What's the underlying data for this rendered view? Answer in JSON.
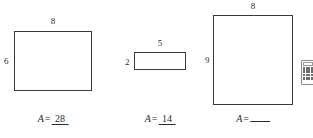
{
  "page": {
    "background_color": "#ffffff",
    "ink_color": "#3a3a3a"
  },
  "figures": [
    {
      "id": "figure-1",
      "name": "rectangle-1",
      "top_label": "8",
      "left_label": "6",
      "area_variable": "A",
      "equals": "=",
      "area_value": "28",
      "answered": true
    },
    {
      "id": "figure-2",
      "name": "rectangle-2",
      "top_label": "5",
      "left_label": "2",
      "area_variable": "A",
      "equals": "=",
      "area_value": "14",
      "answered": true
    },
    {
      "id": "figure-3",
      "name": "rectangle-3",
      "top_label": "8",
      "left_label": "9",
      "area_variable": "A",
      "equals": "=",
      "area_value": "",
      "answered": false
    }
  ],
  "calculator_icon": {
    "name": "calculator-icon",
    "keys": [
      "",
      "",
      "",
      "",
      "",
      "",
      "",
      "",
      "",
      "",
      "",
      "",
      "",
      "",
      "",
      ""
    ]
  }
}
